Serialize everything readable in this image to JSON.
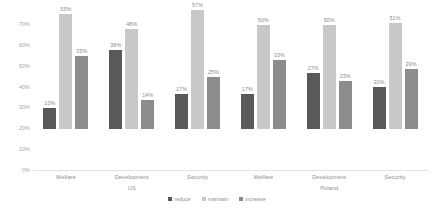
{
  "chart_data": {
    "type": "bar",
    "title": "",
    "xlabel": "",
    "ylabel": "",
    "ylim": [
      0,
      70
    ],
    "grid": false,
    "legend_position": "bottom",
    "tick_labels": [
      "0%",
      "10%",
      "20%",
      "30%",
      "40%",
      "50%",
      "60%",
      "70%"
    ],
    "tick_values": [
      0,
      10,
      20,
      30,
      40,
      50,
      60,
      70
    ],
    "categories": [
      "Welfare",
      "Development",
      "Security",
      "Welfare",
      "Development",
      "Security"
    ],
    "supercategories": [
      {
        "label": "US",
        "span": 3
      },
      {
        "label": "Poland",
        "span": 3
      }
    ],
    "series": [
      {
        "name": "reduce",
        "color": "#595959",
        "values": [
          10,
          38,
          17,
          17,
          27,
          20
        ]
      },
      {
        "name": "maintain",
        "color": "#c8c8c8",
        "values": [
          55,
          48,
          57,
          50,
          50,
          51
        ]
      },
      {
        "name": "increase",
        "color": "#8c8c8c",
        "values": [
          35,
          14,
          25,
          33,
          23,
          29
        ]
      }
    ],
    "data_labels": [
      [
        "10%",
        "55%",
        "35%"
      ],
      [
        "38%",
        "48%",
        "14%"
      ],
      [
        "17%",
        "57%",
        "25%"
      ],
      [
        "17%",
        "50%",
        "33%"
      ],
      [
        "27%",
        "50%",
        "23%"
      ],
      [
        "20%",
        "51%",
        "29%"
      ]
    ]
  }
}
